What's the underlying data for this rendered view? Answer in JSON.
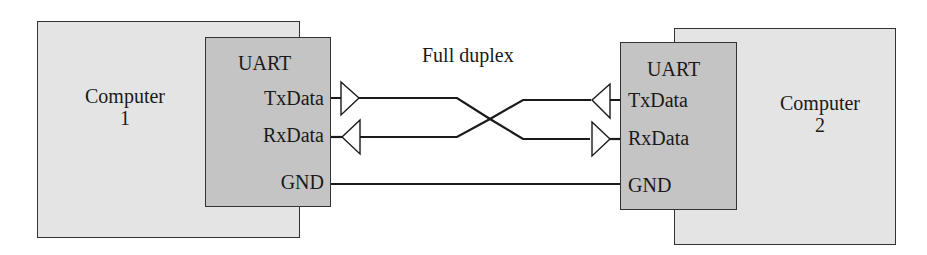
{
  "diagram": {
    "title": "Full duplex",
    "computer1": {
      "name": "Computer",
      "number": "1"
    },
    "computer2": {
      "name": "Computer",
      "number": "2"
    },
    "uart1": {
      "title": "UART",
      "pins": {
        "tx": "TxData",
        "rx": "RxData",
        "gnd": "GND"
      }
    },
    "uart2": {
      "title": "UART",
      "pins": {
        "tx": "TxData",
        "rx": "RxData",
        "gnd": "GND"
      }
    },
    "connections": [
      {
        "from": "Computer 1 TxData",
        "to": "Computer 2 RxData",
        "type": "crossed"
      },
      {
        "from": "Computer 2 TxData",
        "to": "Computer 1 RxData",
        "type": "crossed"
      },
      {
        "from": "Computer 1 GND",
        "to": "Computer 2 GND",
        "type": "straight"
      }
    ],
    "colors": {
      "computer_fill": "#e4e4e4",
      "uart_fill": "#c4c4c4",
      "line": "#1a1a1a"
    }
  }
}
